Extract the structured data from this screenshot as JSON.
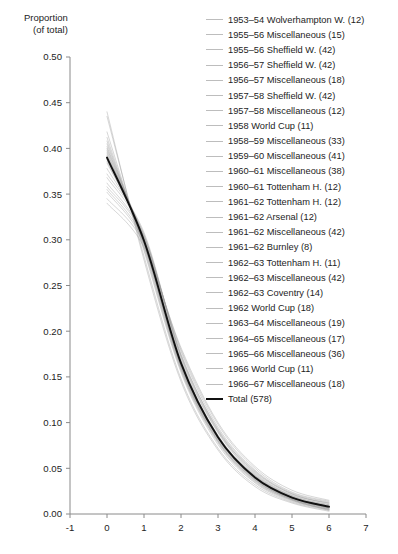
{
  "chart_data": {
    "type": "line",
    "title": "",
    "ylabel_line1": "Proportion",
    "ylabel_line2": "(of total)",
    "xlabel": "",
    "xlim": [
      -1,
      7
    ],
    "ylim": [
      0.0,
      0.5
    ],
    "grid": false,
    "legend_position": "right",
    "xticks": [
      -1,
      0,
      1,
      2,
      3,
      4,
      5,
      6,
      7
    ],
    "xticklabels": [
      "-1",
      "0",
      "1",
      "2",
      "3",
      "4",
      "5",
      "6",
      "7"
    ],
    "yticks": [
      0.0,
      0.05,
      0.1,
      0.15,
      0.2,
      0.25,
      0.3,
      0.35,
      0.4,
      0.45,
      0.5
    ],
    "yticklabels": [
      "0.00",
      "0.05",
      "0.10",
      "0.15",
      "0.20",
      "0.25",
      "0.30",
      "0.35",
      "0.40",
      "0.45",
      "0.50"
    ],
    "x": [
      0,
      1,
      2,
      3,
      4,
      5,
      6
    ],
    "series": [
      {
        "name": "1953–54 Wolverhampton W.",
        "count": 12,
        "label": "1953–54 Wolverhampton W. (12)",
        "style": "thin",
        "values": [
          0.355,
          0.3,
          0.175,
          0.092,
          0.045,
          0.021,
          0.012
        ]
      },
      {
        "name": "1955–56 Miscellaneous",
        "count": 15,
        "label": "1955–56 Miscellaneous (15)",
        "style": "thin",
        "values": [
          0.4,
          0.298,
          0.162,
          0.082,
          0.038,
          0.016,
          0.004
        ]
      },
      {
        "name": "1955–56 Sheffield W.",
        "count": 42,
        "label": "1955–56 Sheffield W. (42)",
        "style": "thin",
        "values": [
          0.378,
          0.305,
          0.168,
          0.086,
          0.042,
          0.019,
          0.008
        ]
      },
      {
        "name": "1956–57 Sheffield W.",
        "count": 42,
        "label": "1956–57 Sheffield W. (42)",
        "style": "thin",
        "values": [
          0.418,
          0.288,
          0.155,
          0.076,
          0.034,
          0.014,
          0.005
        ]
      },
      {
        "name": "1956–57 Miscellaneous",
        "count": 18,
        "label": "1956–57 Miscellaneous (18)",
        "style": "thin",
        "values": [
          0.392,
          0.302,
          0.165,
          0.084,
          0.04,
          0.018,
          0.007
        ]
      },
      {
        "name": "1957–58 Sheffield W.",
        "count": 42,
        "label": "1957–58 Sheffield W. (42)",
        "style": "thin",
        "values": [
          0.372,
          0.308,
          0.172,
          0.09,
          0.044,
          0.02,
          0.01
        ]
      },
      {
        "name": "1957–58 Miscellaneous",
        "count": 12,
        "label": "1957–58 Miscellaneous (12)",
        "style": "thin",
        "values": [
          0.435,
          0.282,
          0.148,
          0.072,
          0.032,
          0.013,
          0.004
        ]
      },
      {
        "name": "1958 World Cup",
        "count": 11,
        "label": "1958 World Cup (11)",
        "style": "thin",
        "values": [
          0.345,
          0.296,
          0.18,
          0.098,
          0.05,
          0.024,
          0.014
        ]
      },
      {
        "name": "1958–59 Miscellaneous",
        "count": 33,
        "label": "1958–59 Miscellaneous (33)",
        "style": "thin",
        "values": [
          0.405,
          0.294,
          0.16,
          0.08,
          0.037,
          0.016,
          0.006
        ]
      },
      {
        "name": "1959–60 Miscellaneous",
        "count": 41,
        "label": "1959–60 Miscellaneous (41)",
        "style": "thin",
        "values": [
          0.386,
          0.3,
          0.166,
          0.085,
          0.041,
          0.018,
          0.008
        ]
      },
      {
        "name": "1960–61 Miscellaneous",
        "count": 38,
        "label": "1960–61 Miscellaneous (38)",
        "style": "thin",
        "values": [
          0.396,
          0.297,
          0.163,
          0.083,
          0.039,
          0.017,
          0.007
        ]
      },
      {
        "name": "1960–61 Tottenham H.",
        "count": 12,
        "label": "1960–61 Tottenham H. (12)",
        "style": "thin",
        "values": [
          0.362,
          0.304,
          0.173,
          0.091,
          0.046,
          0.022,
          0.011
        ]
      },
      {
        "name": "1961–62 Tottenham H.",
        "count": 12,
        "label": "1961–62 Tottenham H. (12)",
        "style": "thin",
        "values": [
          0.412,
          0.29,
          0.157,
          0.078,
          0.035,
          0.015,
          0.005
        ]
      },
      {
        "name": "1961–62 Arsenal",
        "count": 12,
        "label": "1961–62 Arsenal (12)",
        "style": "thin",
        "values": [
          0.34,
          0.292,
          0.182,
          0.1,
          0.052,
          0.026,
          0.015
        ]
      },
      {
        "name": "1961–62 Miscellaneous",
        "count": 42,
        "label": "1961–62 Miscellaneous (42)",
        "style": "thin",
        "values": [
          0.39,
          0.301,
          0.164,
          0.084,
          0.04,
          0.018,
          0.008
        ]
      },
      {
        "name": "1961–62 Burnley",
        "count": 8,
        "label": "1961–62 Burnley (8)",
        "style": "thin",
        "values": [
          0.44,
          0.278,
          0.145,
          0.07,
          0.03,
          0.012,
          0.003
        ]
      },
      {
        "name": "1962–63 Tottenham H.",
        "count": 11,
        "label": "1962–63 Tottenham H. (11)",
        "style": "thin",
        "values": [
          0.368,
          0.306,
          0.17,
          0.089,
          0.043,
          0.02,
          0.01
        ]
      },
      {
        "name": "1962–63 Miscellaneous",
        "count": 42,
        "label": "1962–63 Miscellaneous (42)",
        "style": "thin",
        "values": [
          0.394,
          0.299,
          0.163,
          0.083,
          0.039,
          0.017,
          0.007
        ]
      },
      {
        "name": "1962–63 Coventry",
        "count": 14,
        "label": "1962–63 Coventry (14)",
        "style": "thin",
        "values": [
          0.352,
          0.298,
          0.178,
          0.095,
          0.048,
          0.023,
          0.013
        ]
      },
      {
        "name": "1962 World Cup",
        "count": 18,
        "label": "1962 World Cup (18)",
        "style": "thin",
        "values": [
          0.408,
          0.292,
          0.158,
          0.079,
          0.036,
          0.015,
          0.005
        ]
      },
      {
        "name": "1963–64 Miscellaneous",
        "count": 19,
        "label": "1963–64 Miscellaneous (19)",
        "style": "thin",
        "values": [
          0.384,
          0.302,
          0.167,
          0.086,
          0.042,
          0.019,
          0.009
        ]
      },
      {
        "name": "1964–65 Miscellaneous",
        "count": 17,
        "label": "1964–65 Miscellaneous (17)",
        "style": "thin",
        "values": [
          0.398,
          0.296,
          0.161,
          0.081,
          0.038,
          0.016,
          0.006
        ]
      },
      {
        "name": "1965–66 Miscellaneous",
        "count": 36,
        "label": "1965–66 Miscellaneous (36)",
        "style": "thin",
        "values": [
          0.388,
          0.3,
          0.165,
          0.085,
          0.041,
          0.018,
          0.008
        ]
      },
      {
        "name": "1966 World Cup",
        "count": 11,
        "label": "1966 World Cup (11)",
        "style": "thin",
        "values": [
          0.358,
          0.303,
          0.174,
          0.093,
          0.047,
          0.022,
          0.012
        ]
      },
      {
        "name": "1966–67 Miscellaneous",
        "count": 18,
        "label": "1966–67 Miscellaneous (18)",
        "style": "thin",
        "values": [
          0.402,
          0.295,
          0.16,
          0.08,
          0.037,
          0.016,
          0.006
        ]
      },
      {
        "name": "Total",
        "count": 578,
        "label": "Total (578)",
        "style": "total",
        "values": [
          0.39,
          0.299,
          0.165,
          0.084,
          0.04,
          0.018,
          0.008
        ]
      }
    ]
  }
}
